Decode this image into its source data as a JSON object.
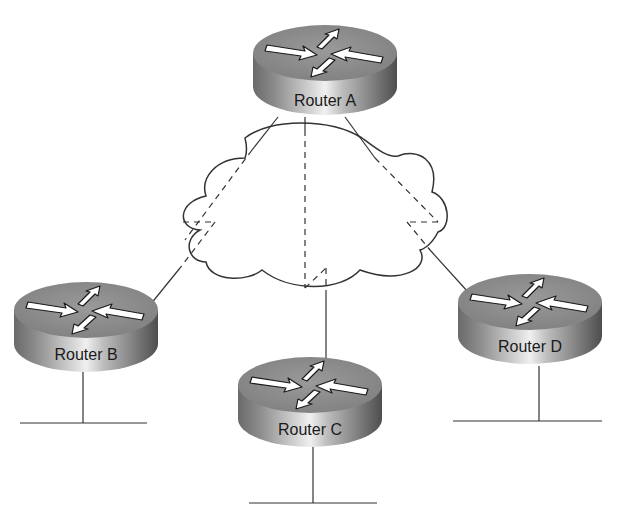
{
  "diagram": {
    "type": "network-topology",
    "colors": {
      "router_top": "#8a8a8a",
      "router_side_dark": "#5a5a5a",
      "router_side_light": "#e6e6e6",
      "line": "#333333",
      "arrow": "#ffffff",
      "label": "#1a1a1a"
    },
    "cloud": {
      "label": ""
    },
    "routers": [
      {
        "id": "A",
        "label": "Router A",
        "cx": 325,
        "top": 25,
        "has_lan": false
      },
      {
        "id": "B",
        "label": "Router B",
        "cx": 86,
        "top": 282,
        "has_lan": true
      },
      {
        "id": "C",
        "label": "Router C",
        "cx": 310,
        "top": 357,
        "has_lan": true
      },
      {
        "id": "D",
        "label": "Router D",
        "cx": 530,
        "top": 274,
        "has_lan": true
      }
    ],
    "links": [
      {
        "from": "Router A",
        "to": "Router B",
        "style": "solid-outside-dashed-inside-cloud"
      },
      {
        "from": "Router A",
        "to": "Router C",
        "style": "solid-outside-dashed-inside-cloud"
      },
      {
        "from": "Router A",
        "to": "Router D",
        "style": "solid-outside-dashed-inside-cloud"
      }
    ],
    "lan_segments": [
      {
        "router": "Router B"
      },
      {
        "router": "Router C"
      },
      {
        "router": "Router D"
      }
    ]
  }
}
